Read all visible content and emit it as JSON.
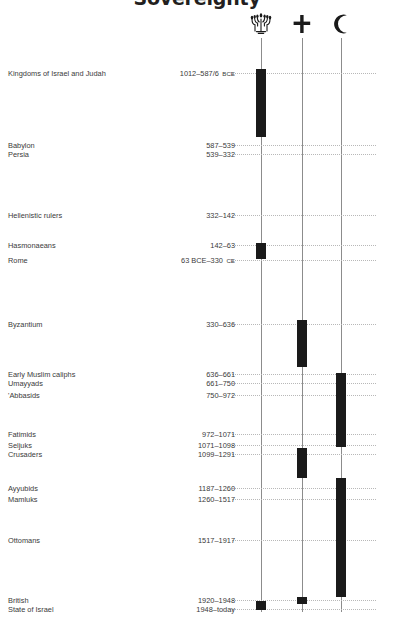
{
  "title": "Sovereignty",
  "columns": [
    {
      "name": "menorah",
      "icon": "menorah-icon",
      "x": 261,
      "label": "Jewish"
    },
    {
      "name": "cross",
      "icon": "cross-icon",
      "x": 302,
      "label": "Christian"
    },
    {
      "name": "crescent",
      "icon": "crescent-icon",
      "x": 341,
      "label": "Muslim"
    }
  ],
  "axis": {
    "top": 38,
    "bottom": 612,
    "color": "#8c8c8c"
  },
  "leaders": {
    "start_x": 232,
    "end_x": 376,
    "color": "#b8b8b8"
  },
  "bar_color": "#1a1a1a",
  "rows": [
    {
      "label": "Kingdoms of Israel and Judah",
      "dates": "1012–587/6",
      "era": "BCE",
      "y": 69
    },
    {
      "label": "Babylon",
      "dates": "587–539",
      "era": "",
      "y": 141
    },
    {
      "label": "Persia",
      "dates": "539–332",
      "era": "",
      "y": 150
    },
    {
      "label": "Hellenistic rulers",
      "dates": "332–142",
      "era": "",
      "y": 211
    },
    {
      "label": "Hasmonaeans",
      "dates": "142–63",
      "era": "",
      "y": 241
    },
    {
      "label": "Rome",
      "dates": "63 BCE–330",
      "era": "CE",
      "y": 256
    },
    {
      "label": "Byzantium",
      "dates": "330–636",
      "era": "",
      "y": 320
    },
    {
      "label": "Early Muslim caliphs",
      "dates": "636–661",
      "era": "",
      "y": 370
    },
    {
      "label": "Umayyads",
      "dates": "661–750",
      "era": "",
      "y": 379
    },
    {
      "label": "'Abbasids",
      "dates": "750–972",
      "era": "",
      "y": 391
    },
    {
      "label": "Fatimids",
      "dates": "972–1071",
      "era": "",
      "y": 430
    },
    {
      "label": "Seljuks",
      "dates": "1071–1098",
      "era": "",
      "y": 441
    },
    {
      "label": "Crusaders",
      "dates": "1099–1291",
      "era": "",
      "y": 450
    },
    {
      "label": "Ayyubids",
      "dates": "1187–1260",
      "era": "",
      "y": 484
    },
    {
      "label": "Mamluks",
      "dates": "1260–1517",
      "era": "",
      "y": 495
    },
    {
      "label": "Ottomans",
      "dates": "1517–1917",
      "era": "",
      "y": 536
    },
    {
      "label": "British",
      "dates": "1920–1948",
      "era": "",
      "y": 596
    },
    {
      "label": "State of Israel",
      "dates": "1948–today",
      "era": "",
      "y": 605
    }
  ],
  "chart_data": {
    "type": "bar",
    "title": "Sovereignty",
    "orientation": "vertical-timeline",
    "categories": [
      "menorah",
      "cross",
      "crescent"
    ],
    "series": [
      {
        "name": "Kingdoms of Israel and Judah",
        "column": "menorah",
        "dates": "1012–587/6 BCE",
        "y_start": 69,
        "y_end": 137
      },
      {
        "name": "Hasmonaeans",
        "column": "menorah",
        "dates": "142–63 BCE",
        "y_start": 243,
        "y_end": 259
      },
      {
        "name": "Byzantium",
        "column": "cross",
        "dates": "330–636 CE",
        "y_start": 320,
        "y_end": 367
      },
      {
        "name": "Early Muslim caliphs / Umayyads / 'Abbasids / Fatimids / Seljuks",
        "column": "crescent",
        "dates": "636–1099",
        "y_start": 373,
        "y_end": 447
      },
      {
        "name": "Crusaders",
        "column": "cross",
        "dates": "1099–1291",
        "y_start": 448,
        "y_end": 478
      },
      {
        "name": "Ayyubids / Mamluks / Ottomans",
        "column": "crescent",
        "dates": "1187–1917",
        "y_start": 478,
        "y_end": 597
      },
      {
        "name": "British",
        "column": "cross",
        "dates": "1920–1948",
        "y_start": 597,
        "y_end": 604
      },
      {
        "name": "State of Israel",
        "column": "menorah",
        "dates": "1948–today",
        "y_start": 601,
        "y_end": 610
      }
    ],
    "xlabel": "",
    "ylabel": "",
    "grid": "dotted-leaders"
  }
}
